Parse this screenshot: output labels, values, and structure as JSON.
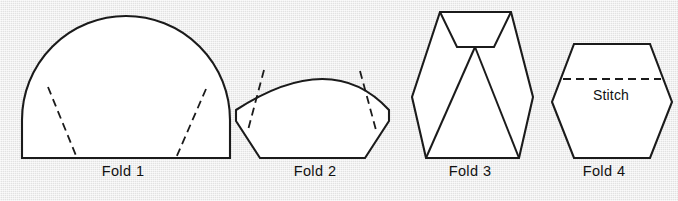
{
  "page": {
    "background_color": "#e9e9e9",
    "line_color": "#1b1b1b",
    "shape_fill": "#ffffff",
    "width": 678,
    "height": 201
  },
  "figures": [
    {
      "id": "fold-1",
      "caption": "Fold 1",
      "caption_x": 123,
      "caption_y": 176,
      "shape": "semicircle-dome",
      "outline": "M 22 158 L 22 120 A 104 104 0 0 1 230 120 L 230 158 Z",
      "dashed_lines": [
        "M 48 87 L 77 158",
        "M 206 89 L 176 158"
      ]
    },
    {
      "id": "fold-2",
      "caption": "Fold 2",
      "caption_x": 315,
      "caption_y": 176,
      "shape": "folded-fan",
      "outline": "M 236 121 L 260 158 L 365 158 L 389 121 L 389 110 Q 332 48 236 110 Z",
      "dashed_lines": [
        "M 264 70 L 248 130",
        "M 360 71 L 376 130"
      ]
    },
    {
      "id": "fold-3",
      "caption": "Fold 3",
      "caption_x": 470,
      "caption_y": 176,
      "shape": "tall-hexagon-with-pleats",
      "outline": "M 440 12 L 511 12 L 533 97 L 519 158 L 426 158 L 412 97 Z",
      "inner_lines": [
        "M 440 12 L 457 47 L 494 47 L 511 12",
        "M 457 47 L 475 47 L 475 47",
        "M 475 47 L 426 158",
        "M 475 47 L 519 158",
        "M 457 47 L 494 47"
      ]
    },
    {
      "id": "fold-4",
      "caption": "Fold 4",
      "caption_x": 604,
      "caption_y": 176,
      "shape": "hexagon",
      "outline": "M 574 44 L 650 44 L 672 102 L 650 158 L 574 158 L 552 102 Z",
      "dashed_lines": [
        "M 563 79 L 661 79"
      ],
      "annotation": {
        "label": "Stitch",
        "x": 611,
        "y": 100
      }
    }
  ]
}
